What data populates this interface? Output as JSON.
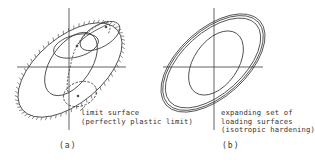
{
  "figure": {
    "panel_a": {
      "caption": "(a)",
      "label_line1": "limit surface",
      "label_line2": "(perfectly plastic limit)"
    },
    "panel_b": {
      "caption": "(b)",
      "label_line1": "expanding set of",
      "label_line2": "loading surfaces",
      "label_line3": "(isotropic hardening)"
    },
    "colors": {
      "line": "#3a3a3a",
      "background": "#ffffff"
    }
  }
}
